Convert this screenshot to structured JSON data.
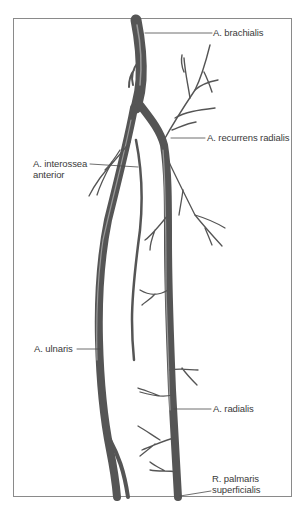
{
  "figure": {
    "type": "anatomical-illustration",
    "colors": {
      "vessel": "#555555",
      "vessel_highlight": "#8e8e8e",
      "leader_line": "#4a4a4a",
      "frame": "#8a8a8a",
      "label_text": "#3a3a3a"
    }
  },
  "labels": {
    "brachialis": "A. brachialis",
    "recurrens_radialis": "A. recurrens radialis",
    "interossea_anterior_line1": "A. interossea",
    "interossea_anterior_line2": "anterior",
    "ulnaris": "A. ulnaris",
    "radialis": "A. radialis",
    "palmaris_line1": "R. palmaris",
    "palmaris_line2": "superficialis"
  }
}
